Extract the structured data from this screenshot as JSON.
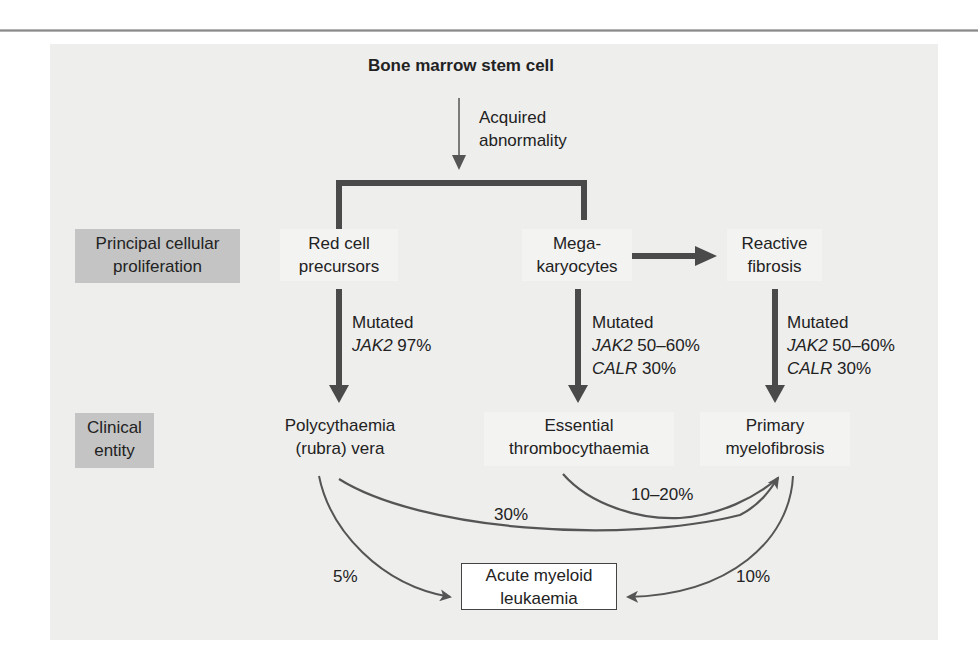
{
  "diagram": {
    "root": "Bone marrow stem cell",
    "root_arrow_label": [
      "Acquired",
      "abnormality"
    ],
    "row_labels": {
      "proliferation": [
        "Principal cellular",
        "proliferation"
      ],
      "clinical": [
        "Clinical",
        "entity"
      ]
    },
    "proliferation_nodes": [
      {
        "lines": [
          "Red cell",
          "precursors"
        ]
      },
      {
        "lines": [
          "Mega-",
          "karyocytes"
        ]
      },
      {
        "lines": [
          "Reactive",
          "fibrosis"
        ]
      }
    ],
    "mutation_labels": [
      {
        "line1": "Mutated",
        "gene1": "JAK2",
        "val1": " 97%"
      },
      {
        "line1": "Mutated",
        "gene1": "JAK2",
        "val1": " 50–60%",
        "gene2": "CALR",
        "val2": " 30%"
      },
      {
        "line1": "Mutated",
        "gene1": "JAK2",
        "val1": " 50–60%",
        "gene2": "CALR",
        "val2": " 30%"
      }
    ],
    "clinical_nodes": [
      {
        "lines": [
          "Polycythaemia",
          "(rubra) vera"
        ]
      },
      {
        "lines": [
          "Essential",
          "thrombocythaemia"
        ]
      },
      {
        "lines": [
          "Primary",
          "myelofibrosis"
        ]
      }
    ],
    "outcome": {
      "lines": [
        "Acute myeloid",
        "leukaemia"
      ]
    },
    "transitions": {
      "pv_to_mf": "30%",
      "et_to_mf": "10–20%",
      "pv_to_aml": "5%",
      "mf_to_aml": "10%"
    },
    "colors": {
      "panel": "#eeeeed",
      "label_box": "#c4c4c4",
      "thick_arrow": "#4a4a4a",
      "thin_arrow": "#555555",
      "text": "#222222"
    }
  }
}
